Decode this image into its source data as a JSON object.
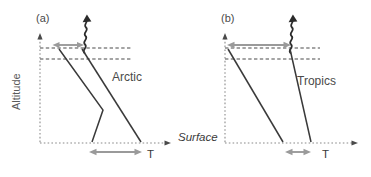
{
  "figure": {
    "axis_y_label": "Altitude",
    "axis_x_label_left": "T",
    "axis_x_label_right": "T",
    "surface_label": "Surface",
    "accent_gray": "#9a9a9a",
    "line_color": "#3a3a3a",
    "guide_color": "#4a4a4a",
    "background": "#ffffff"
  },
  "panels": [
    {
      "key": "a",
      "label": "(a)",
      "region": "Arctic",
      "top_arrow_kind": "double-headed-horizontal-narrow",
      "bottom_arrow_kind": "double-headed-horizontal-wide",
      "radiation_icon": "wavy-up-arrow-icon",
      "profiles": [
        {
          "name": "inversion-profile",
          "description": "kinked temperature profile with low-level inversion"
        },
        {
          "name": "reference-profile",
          "description": "straight sloping temperature profile"
        }
      ],
      "guide_lines": 2
    },
    {
      "key": "b",
      "label": "(b)",
      "region": "Tropics",
      "top_arrow_kind": "double-headed-horizontal-wide",
      "bottom_arrow_kind": "double-headed-horizontal-narrow",
      "radiation_icon": "wavy-up-arrow-icon",
      "profiles": [
        {
          "name": "moist-adiabat-profile",
          "description": "straight steep temperature profile"
        },
        {
          "name": "reference-profile",
          "description": "straight sloping temperature profile"
        }
      ],
      "guide_lines": 2
    }
  ]
}
